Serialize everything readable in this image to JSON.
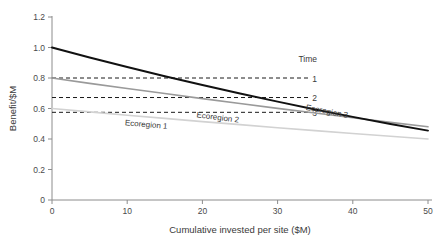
{
  "chart_data": {
    "type": "line",
    "title": "",
    "xlabel": "Cumulative invested per site ($M)",
    "ylabel": "Benefit/$M",
    "xlim": [
      0,
      50
    ],
    "ylim": [
      0,
      1.2
    ],
    "xticks": [
      "0",
      "10",
      "20",
      "30",
      "40",
      "50"
    ],
    "xtick_values": [
      0,
      10,
      20,
      30,
      40,
      50
    ],
    "yticks": [
      "0",
      "0.2",
      "0.4",
      "0.6",
      "0.8",
      "1.0",
      "1.2"
    ],
    "ytick_values": [
      0,
      0.2,
      0.4,
      0.6,
      0.8,
      1.0,
      1.2
    ],
    "grid": false,
    "legend_position": "inside-upper-right",
    "legend_title": "Time",
    "series": [
      {
        "name": "Ecoregion 3",
        "label": "Ecoregion 3",
        "color": "#111111",
        "linewidth": 2.0,
        "x": [
          0,
          5,
          10,
          15,
          20,
          25,
          30,
          35,
          40,
          45,
          50
        ],
        "values": [
          1.0,
          0.935,
          0.872,
          0.812,
          0.754,
          0.698,
          0.645,
          0.594,
          0.545,
          0.499,
          0.455
        ],
        "label_x": 36.5,
        "label_y": 0.565
      },
      {
        "name": "Ecoregion 2",
        "label": "Ecoregion 2",
        "color": "#9a9a9a",
        "linewidth": 1.6,
        "x": [
          0,
          5,
          10,
          15,
          20,
          25,
          30,
          35,
          40,
          45,
          50
        ],
        "values": [
          0.8,
          0.765,
          0.731,
          0.698,
          0.665,
          0.633,
          0.601,
          0.57,
          0.539,
          0.509,
          0.48
        ],
        "label_x": 22.0,
        "label_y": 0.525
      },
      {
        "name": "Ecoregion 1",
        "label": "Ecoregion 1",
        "color": "#d2d2d2",
        "linewidth": 1.6,
        "x": [
          0,
          5,
          10,
          15,
          20,
          25,
          30,
          35,
          40,
          45,
          50
        ],
        "values": [
          0.6,
          0.578,
          0.556,
          0.535,
          0.514,
          0.494,
          0.474,
          0.455,
          0.436,
          0.418,
          0.4
        ],
        "label_x": 12.5,
        "label_y": 0.478
      }
    ],
    "threshold_lines": [
      {
        "label": "1",
        "y": 0.8,
        "x_start": 0,
        "x_end": 34.2,
        "style": "dashed",
        "color": "#1a1a1a"
      },
      {
        "label": "2",
        "y": 0.672,
        "x_start": 0,
        "x_end": 34.2,
        "style": "dashed",
        "color": "#1a1a1a"
      },
      {
        "label": "3",
        "y": 0.575,
        "x_start": 0,
        "x_end": 34.2,
        "style": "dashed",
        "color": "#1a1a1a"
      }
    ],
    "annotations": [
      {
        "text": "Time",
        "x": 34.0,
        "y": 0.905
      }
    ]
  },
  "colors": {
    "axis": "#8c8c8c",
    "text": "#3a3a3a",
    "background": "#ffffff",
    "series_dark": "#111111",
    "series_mid": "#9a9a9a",
    "series_light": "#d2d2d2",
    "threshold": "#1a1a1a"
  }
}
